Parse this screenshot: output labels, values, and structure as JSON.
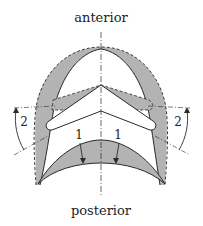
{
  "labels": {
    "top": "anterior",
    "bottom": "posterior",
    "arrow_left_inner": "1",
    "arrow_right_inner": "1",
    "arrow_left_outer": "2",
    "arrow_right_outer": "2"
  },
  "colors": {
    "shade": "#b3b3b3",
    "stroke": "#2a2a2a",
    "background": "#ffffff"
  }
}
